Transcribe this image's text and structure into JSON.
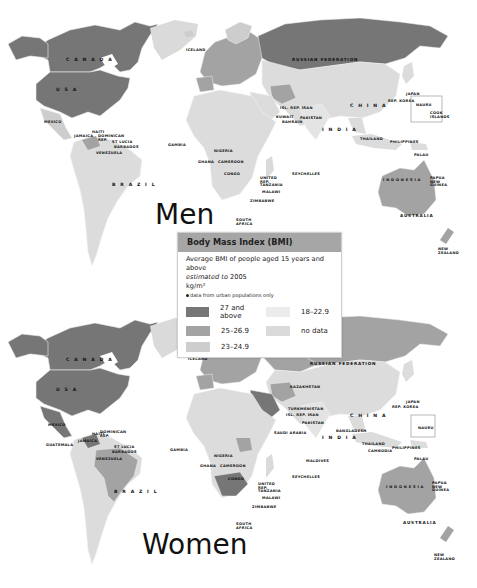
{
  "panels": [
    {
      "title": "Men",
      "labels": {
        "canada": "C A N A D A",
        "usa": "U S A",
        "russia": "RUSSIAN FEDERATION",
        "china": "C H I N A",
        "india": "I N D I A",
        "brazil": "B R A Z I L",
        "indonesia": "I N D O N E S I A",
        "australia": "AUSTRALIA",
        "iceland": "ICELAND",
        "mexico": "MEXICO",
        "haiti": "HAITI",
        "jamaica": "JAMAICA",
        "dominican_rep": "DOMINICAN REP.",
        "st_lucia": "ST LUCIA",
        "barbados": "BARBADOS",
        "venezuela": "VENEZUELA",
        "gambia": "GAMBIA",
        "nigeria": "NIGERIA",
        "ghana": "GHANA",
        "cameroon": "CAMEROON",
        "congo": "CONGO",
        "tanzania": "UNITED REP. TANZANIA",
        "malawi": "MALAWI",
        "zimbabwe": "ZIMBABWE",
        "south_africa": "SOUTH AFRICA",
        "seychelles": "SEYCHELLES",
        "pakistan": "PAKISTAN",
        "iran": "ISL. REP. IRAN",
        "kuwait": "KUWAIT",
        "bahrain": "BAHRAIN",
        "japan": "JAPAN",
        "rep_korea": "REP. KOREA",
        "thailand": "THAILAND",
        "philippines": "PHILIPPINES",
        "palau": "PALAU",
        "nauru": "NAURU",
        "cook_islands": "COOK ISLANDS",
        "papua_new_guinea": "PAPUA NEW GUINEA",
        "new_zealand": "NEW ZEALAND"
      }
    },
    {
      "title": "Women",
      "labels": {
        "canada": "C A N A D A",
        "usa": "U S A",
        "russia": "RUSSIAN FEDERATION",
        "kazakhstan": "KAZAKHSTAN",
        "turkmenistan": "TURKMENISTAN",
        "china": "C H I N A",
        "india": "I N D I A",
        "bangladesh": "BANGLADESH",
        "brazil": "B R A Z I L",
        "indonesia": "I N D O N E S I A",
        "australia": "AUSTRALIA",
        "iceland": "ICELAND",
        "mexico": "MEXICO",
        "guatemala": "GUATEMALA",
        "jamaica": "JAMAICA",
        "haiti": "HAITI",
        "dominican_rep": "DOMINICAN REP.",
        "st_lucia": "ST LUCIA",
        "barbados": "BARBADOS",
        "venezuela": "VENEZUELA",
        "gambia": "GAMBIA",
        "nigeria": "NIGERIA",
        "ghana": "GHANA",
        "cameroon": "CAMEROON",
        "congo": "CONGO",
        "tanzania": "UNITED REP. TANZANIA",
        "malawi": "MALAWI",
        "zimbabwe": "ZIMBABWE",
        "south_africa": "SOUTH AFRICA",
        "seychelles": "SEYCHELLES",
        "maldives": "MALDIVES",
        "pakistan": "PAKISTAN",
        "iran": "ISL. REP. IRAN",
        "saudi_arabia": "SAUDI ARABIA",
        "japan": "JAPAN",
        "rep_korea": "REP. KOREA",
        "thailand": "THAILAND",
        "cambodia": "CAMBODIA",
        "philippines": "PHILIPPINES",
        "palau": "PALAU",
        "nauru": "NAURU",
        "papua_new_guinea": "PAPUA NEW GUINEA",
        "new_zealand": "NEW ZEALAND"
      }
    }
  ],
  "legend": {
    "title": "Body Mass Index (BMI)",
    "description_line1": "Average BMI of people aged 15 years and above",
    "description_italic": "estimated to",
    "description_year": " 2005",
    "unit": "kg/m²",
    "note": "data from urban populations only",
    "categories": [
      {
        "label": "27 and above",
        "color": "#767676"
      },
      {
        "label": "25–26.9",
        "color": "#a3a3a3"
      },
      {
        "label": "23–24.9",
        "color": "#cdcdcd"
      },
      {
        "label": "18–22.9",
        "color": "#e7e7e7"
      },
      {
        "label": "no data",
        "color": "#dadada"
      }
    ]
  },
  "colors": {
    "c27": "#767676",
    "c25": "#a3a3a3",
    "c23": "#cdcdcd",
    "c18": "#e4e4e4",
    "nodata": "#dadada",
    "header": "#a6a6a6"
  }
}
